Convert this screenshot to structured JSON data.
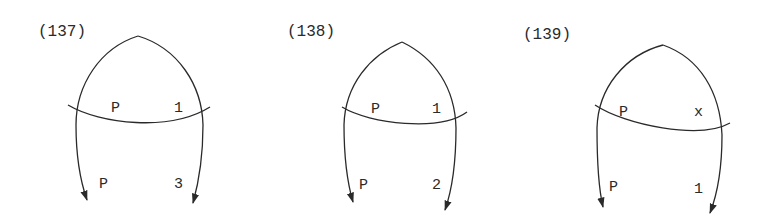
{
  "diagrams": [
    {
      "id": "(137)",
      "top_left": "P",
      "top_right": "1",
      "bottom_left": "P",
      "bottom_right": "3"
    },
    {
      "id": "(138)",
      "top_left": "P",
      "top_right": "1",
      "bottom_left": "P",
      "bottom_right": "2"
    },
    {
      "id": "(139)",
      "top_left": "P",
      "top_right": "x",
      "bottom_left": "P",
      "bottom_right": "1"
    }
  ],
  "colors": {
    "ink": "#2a2a2a",
    "background": "#ffffff"
  }
}
